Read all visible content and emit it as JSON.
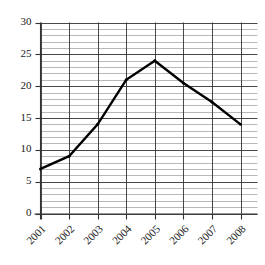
{
  "chart_data": {
    "type": "line",
    "title": "",
    "xlabel": "",
    "ylabel": "",
    "categories": [
      "2001",
      "2002",
      "2003",
      "2004",
      "2005",
      "2006",
      "2007",
      "2008"
    ],
    "values": [
      7,
      9,
      14,
      21,
      24,
      20.5,
      17.5,
      14
    ],
    "series": [
      {
        "name": "",
        "values": [
          7,
          9,
          14,
          21,
          24,
          20.5,
          17.5,
          14
        ]
      }
    ],
    "ylim": [
      0,
      30
    ],
    "ytick_labels": [
      "0",
      "5",
      "10",
      "15",
      "20",
      "25",
      "30"
    ],
    "ytick_values": [
      0,
      5,
      10,
      15,
      20,
      25,
      30
    ],
    "minor_tick_step": 1,
    "grid": "both",
    "legend": "none",
    "xtick_rotation": 45,
    "line_color": "#000000",
    "grid_color_major": "#333333",
    "grid_color_minor": "#9a9a9a",
    "background_color": "#ffffff"
  }
}
